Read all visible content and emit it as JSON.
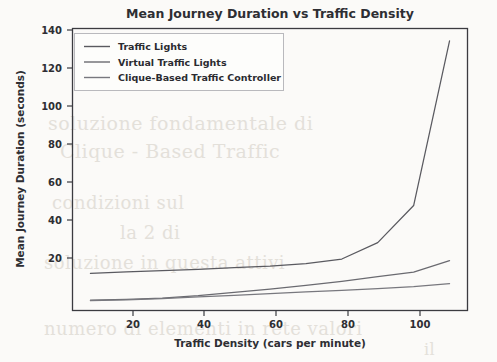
{
  "figure": {
    "background_color": "#fbfaf8",
    "axes_color": "#3b3b40",
    "text_color": "#2e2e33"
  },
  "chart_data": {
    "type": "line",
    "title": "Mean Journey Duration vs Traffic Density",
    "xlabel": "Traffic Density (cars per minute)",
    "ylabel": "Mean Journey Duration (seconds)",
    "xlim": [
      5,
      115
    ],
    "ylim": [
      5,
      142
    ],
    "xticks": [
      20,
      40,
      60,
      80,
      100
    ],
    "yticks": [
      20,
      40,
      60,
      80,
      100,
      120,
      140
    ],
    "grid": false,
    "legend_position": "upper left",
    "x": [
      10,
      20,
      30,
      40,
      50,
      60,
      70,
      80,
      90,
      100,
      110
    ],
    "series": [
      {
        "name": "Traffic Lights",
        "color": "#5a5a60",
        "values": [
          23.0,
          23.8,
          24.4,
          25.0,
          25.8,
          26.6,
          27.8,
          30.0,
          38.0,
          56.0,
          136.0
        ]
      },
      {
        "name": "Virtual Traffic Lights",
        "color": "#6a6a70",
        "values": [
          10.0,
          10.4,
          11.0,
          12.2,
          13.8,
          15.4,
          17.2,
          19.2,
          21.4,
          23.6,
          29.2
        ]
      },
      {
        "name": "Clique-Based Traffic Controller",
        "color": "#78787e",
        "values": [
          9.8,
          10.2,
          10.8,
          11.6,
          12.4,
          13.2,
          14.0,
          14.8,
          15.6,
          16.6,
          18.0
        ]
      }
    ]
  },
  "legend": {
    "items": [
      {
        "label": "Traffic Lights"
      },
      {
        "label": "Virtual Traffic Lights"
      },
      {
        "label": "Clique-Based Traffic Controller"
      }
    ]
  },
  "ghost_text": {
    "lines": [
      "soluzione fondamentale di",
      "Clique - Based Traffic",
      "condizioni   sul",
      "la  2  di",
      "soluzione   in  questa  attivi",
      "numero di  elementi  in  rete   valori",
      "il"
    ]
  }
}
